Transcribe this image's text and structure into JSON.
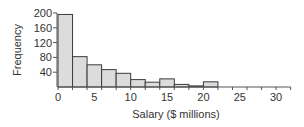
{
  "chart_data": {
    "type": "bar",
    "subtype": "histogram",
    "title": "",
    "xlabel": "Salary ($ millions)",
    "ylabel": "Frequency",
    "bin_width": 2,
    "bins": [
      {
        "start": 0,
        "end": 2,
        "count": 196
      },
      {
        "start": 2,
        "end": 4,
        "count": 82
      },
      {
        "start": 4,
        "end": 6,
        "count": 60
      },
      {
        "start": 6,
        "end": 8,
        "count": 47
      },
      {
        "start": 8,
        "end": 10,
        "count": 37
      },
      {
        "start": 10,
        "end": 12,
        "count": 20
      },
      {
        "start": 12,
        "end": 14,
        "count": 13
      },
      {
        "start": 14,
        "end": 16,
        "count": 22
      },
      {
        "start": 16,
        "end": 18,
        "count": 7
      },
      {
        "start": 18,
        "end": 20,
        "count": 3
      },
      {
        "start": 20,
        "end": 22,
        "count": 14
      }
    ],
    "categories": [
      "0-2",
      "2-4",
      "4-6",
      "6-8",
      "8-10",
      "10-12",
      "12-14",
      "14-16",
      "16-18",
      "18-20",
      "20-22"
    ],
    "values": [
      196,
      82,
      60,
      47,
      37,
      20,
      13,
      22,
      7,
      3,
      14
    ],
    "x_ticks": [
      0,
      5,
      10,
      15,
      20,
      25,
      30
    ],
    "x_minor_ticks": [
      0,
      2,
      4,
      6,
      8,
      10,
      12,
      14,
      16,
      18,
      20,
      22,
      24,
      26,
      28,
      30,
      32
    ],
    "y_ticks": [
      40,
      80,
      120,
      160,
      200
    ],
    "xlim": [
      0,
      32
    ],
    "ylim": [
      0,
      200
    ],
    "grid": false,
    "legend": null,
    "colors": {
      "bar_fill": "#dcdcdc",
      "bar_stroke": "#3c3c3c",
      "axis": "#555555",
      "text": "#333333"
    }
  }
}
